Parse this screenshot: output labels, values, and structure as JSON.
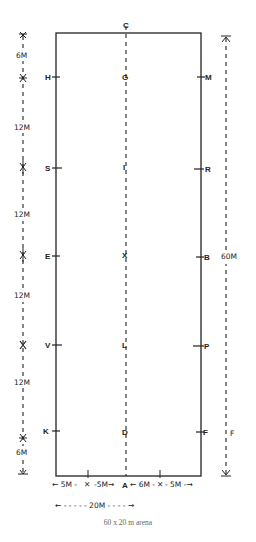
{
  "diagram": {
    "caption": "60 x 20 m arena",
    "arena": {
      "length_m": 60,
      "width_m": 20
    },
    "center_line_letters": [
      "C",
      "G",
      "I",
      "X",
      "L",
      "D",
      "A"
    ],
    "left_side_letters": [
      "H",
      "S",
      "E",
      "V",
      "K"
    ],
    "right_side_letters": [
      "M",
      "R",
      "B",
      "P",
      "F"
    ],
    "left_dimensions": [
      "6M",
      "12M",
      "12M",
      "12M",
      "12M",
      "6M"
    ],
    "right_dimension": "60M",
    "right_extra_letter": "F",
    "bottom_dimensions": [
      "5M",
      "5M",
      "A",
      "6M",
      "5M"
    ],
    "bottom_total": "20M",
    "colors": {
      "line": "#222222",
      "caption": "#666666",
      "background": "#ffffff"
    }
  },
  "labels": {
    "C": "C",
    "G": "G",
    "I": "I",
    "X": "X",
    "L": "L",
    "D": "D",
    "A": "A",
    "H": "H",
    "S": "S",
    "E": "E",
    "V": "V",
    "K": "K",
    "M": "M",
    "R": "R",
    "B": "B",
    "P": "P",
    "F": "F",
    "dim6top": "6M",
    "dim12a": "12M",
    "dim12b": "12M",
    "dim12c": "12M",
    "dim12d": "12M",
    "dim6bottom": "6M",
    "dim60": "60M",
    "farF": "F",
    "b1": "← 5M -",
    "b2": "-5M→",
    "b3": "← 6M -",
    "b4": "- 5M -→",
    "total": "← - - - - - 20M - - - - →"
  }
}
